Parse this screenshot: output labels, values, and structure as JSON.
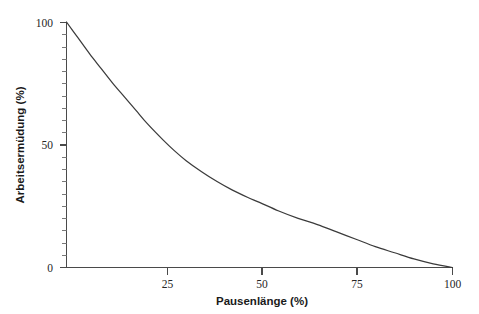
{
  "chart_data": {
    "type": "line",
    "title": "",
    "subtitle": "",
    "xlabel": "Pausenlänge (%)",
    "ylabel": "Arbeitsermüdung (%)",
    "xlim": [
      0,
      104
    ],
    "ylim": [
      0,
      104
    ],
    "x_ticks": [
      25,
      50,
      75,
      100
    ],
    "x_tick_labels": [
      "25",
      "50",
      "75",
      "100"
    ],
    "y_ticks": [
      0,
      50,
      100
    ],
    "y_tick_labels": [
      "0",
      "50",
      "100"
    ],
    "x_minor_tick_step": 0,
    "y_minor_tick_step": 5,
    "grid": false,
    "legend": null,
    "legend_position": "none",
    "series": [
      {
        "name": "Arbeitsermüdung",
        "color": "#3b3b3b",
        "x": [
          0,
          3,
          6,
          9,
          12,
          15,
          18,
          21,
          25,
          28,
          31,
          35,
          39,
          43,
          47,
          50,
          55,
          60,
          65,
          70,
          75,
          80,
          85,
          90,
          95,
          100
        ],
        "values": [
          100,
          93.5,
          87,
          81,
          75,
          69.5,
          64,
          58.5,
          52,
          47.5,
          43.5,
          39,
          35,
          31.5,
          28.5,
          26.5,
          23,
          20,
          17.5,
          14.5,
          11.5,
          8.5,
          6,
          3.5,
          1.5,
          0
        ]
      }
    ],
    "annotations": []
  },
  "axis_labels": {
    "x_title": "Pausenlänge (%)",
    "y_title": "Arbeitsermüdung (%)"
  },
  "tick_text": {
    "x": [
      "25",
      "50",
      "75",
      "100"
    ],
    "y": [
      "100",
      "50",
      "0"
    ]
  },
  "colors": {
    "curve": "#3b3b3b",
    "axis": "#4a4a4a",
    "text": "#1a1a1a",
    "background": "#ffffff"
  }
}
